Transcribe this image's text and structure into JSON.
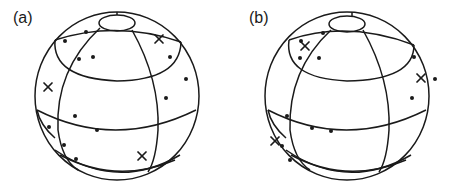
{
  "figure": {
    "panels": [
      {
        "id": "a",
        "label": "(a)",
        "sphere": {
          "cx": 117,
          "cy": 96,
          "r": 82
        },
        "dots": [
          [
            86,
            32
          ],
          [
            65,
            41
          ],
          [
            79,
            59
          ],
          [
            93,
            57
          ],
          [
            170,
            57
          ],
          [
            186,
            79
          ],
          [
            166,
            98
          ],
          [
            75,
            116
          ],
          [
            49,
            127
          ],
          [
            97,
            130
          ],
          [
            64,
            145
          ],
          [
            76,
            159
          ]
        ],
        "crosses": [
          [
            159,
            39
          ],
          [
            48,
            87
          ],
          [
            142,
            156
          ]
        ]
      },
      {
        "id": "b",
        "label": "(b)",
        "sphere": {
          "cx": 121,
          "cy": 96,
          "r": 82
        },
        "dots": [
          [
            58,
            33
          ],
          [
            36,
            41
          ],
          [
            35,
            58
          ],
          [
            54,
            58
          ],
          [
            149,
            57
          ],
          [
            170,
            79
          ],
          [
            147,
            98
          ],
          [
            22,
            116
          ],
          [
            47,
            128
          ],
          [
            66,
            131
          ],
          [
            17,
            146
          ],
          [
            25,
            160
          ]
        ],
        "crosses": [
          [
            40,
            46
          ],
          [
            156,
            78
          ],
          [
            10,
            141
          ]
        ]
      }
    ]
  }
}
